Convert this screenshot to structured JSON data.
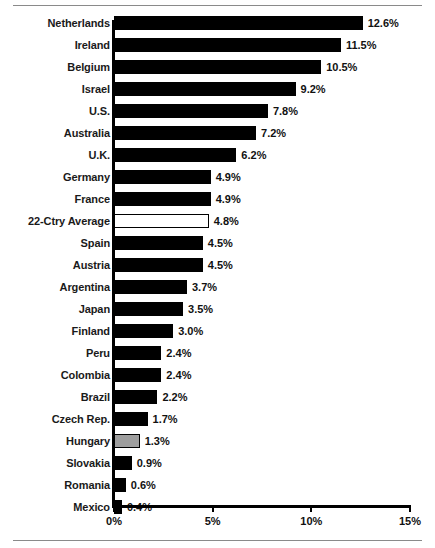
{
  "chart_data": {
    "type": "bar",
    "orientation": "horizontal",
    "title": "",
    "subtitle": "",
    "xlabel": "",
    "ylabel": "",
    "xlim": [
      0,
      15
    ],
    "grid": false,
    "legend": false,
    "value_suffix": "%",
    "categories": [
      "Netherlands",
      "Ireland",
      "Belgium",
      "Israel",
      "U.S.",
      "Australia",
      "U.K.",
      "Germany",
      "France",
      "22-Ctry Average",
      "Spain",
      "Austria",
      "Argentina",
      "Japan",
      "Finland",
      "Peru",
      "Colombia",
      "Brazil",
      "Czech Rep.",
      "Hungary",
      "Slovakia",
      "Romania",
      "Mexico"
    ],
    "values": [
      12.6,
      11.5,
      10.5,
      9.2,
      7.8,
      7.2,
      6.2,
      4.9,
      4.9,
      4.8,
      4.5,
      4.5,
      3.7,
      3.5,
      3.0,
      2.4,
      2.4,
      2.2,
      1.7,
      1.3,
      0.9,
      0.6,
      0.4
    ],
    "value_labels": [
      "12.6%",
      "11.5%",
      "10.5%",
      "9.2%",
      "7.8%",
      "7.2%",
      "6.2%",
      "4.9%",
      "4.9%",
      "4.8%",
      "4.5%",
      "4.5%",
      "3.7%",
      "3.5%",
      "3.0%",
      "2.4%",
      "2.4%",
      "2.2%",
      "1.7%",
      "1.3%",
      "0.9%",
      "0.6%",
      "0.4%"
    ],
    "bar_styles": [
      "black",
      "black",
      "black",
      "black",
      "black",
      "black",
      "black",
      "black",
      "black",
      "white",
      "black",
      "black",
      "black",
      "black",
      "black",
      "black",
      "black",
      "black",
      "black",
      "gray",
      "black",
      "black",
      "black"
    ],
    "xticks": [
      0,
      5,
      10,
      15
    ],
    "xtick_labels": [
      "0%",
      "5%",
      "10%",
      "15%"
    ],
    "colors": {
      "bar_black": "#000000",
      "bar_white": "#ffffff",
      "bar_gray": "#9e9e9e",
      "axis": "#000000",
      "text": "#111111",
      "background": "#ffffff",
      "rule": "#8a8a8a"
    }
  }
}
